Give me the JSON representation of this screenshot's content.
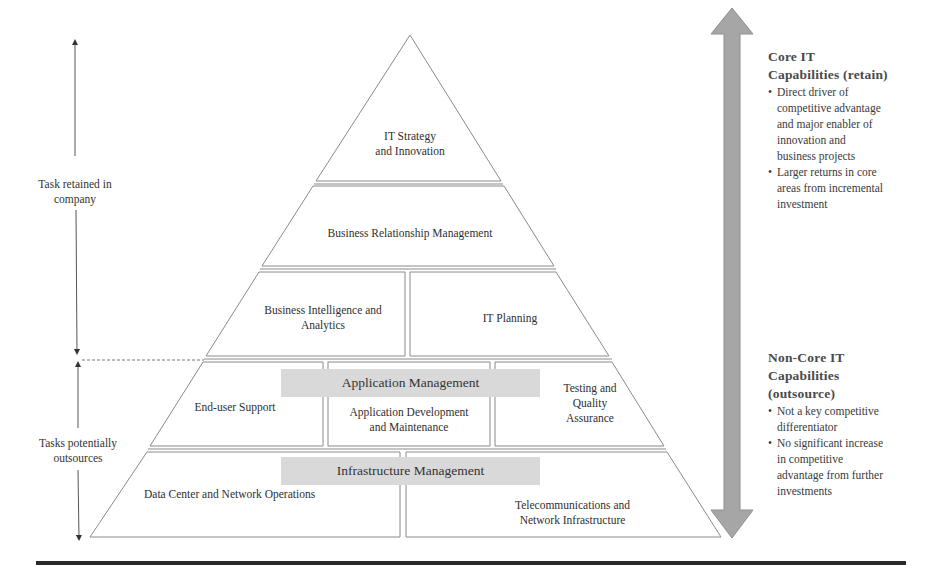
{
  "left_axis": {
    "upper_label": "Task retained in company",
    "upper_label_lines": [
      "Task retained in",
      "company"
    ],
    "lower_label_lines": [
      "Tasks potentially",
      "outsources"
    ]
  },
  "pyramid": {
    "tier1": {
      "lines": [
        "IT Strategy",
        "and Innovation"
      ]
    },
    "tier2": {
      "label": "Business Relationship Management"
    },
    "tier3": {
      "left": {
        "lines": [
          "Business Intelligence and",
          "Analytics"
        ]
      },
      "right": {
        "label": "IT Planning"
      }
    },
    "tier4": {
      "band": "Application Management",
      "left": {
        "label": "End-user Support"
      },
      "center": {
        "lines": [
          "Application Development",
          "and Maintenance"
        ]
      },
      "right": {
        "lines": [
          "Testing and",
          "Quality",
          "Assurance"
        ]
      }
    },
    "tier5": {
      "band": "Infrastructure Management",
      "left": {
        "label": "Data Center and Network Operations"
      },
      "right": {
        "lines": [
          "Telecommunications and",
          "Network Infrastructure"
        ]
      }
    }
  },
  "right_panel": {
    "core": {
      "heading_lines": [
        "Core IT",
        "Capabilities  (retain)"
      ],
      "bullets": [
        {
          "lines": [
            "Direct driver of",
            "competitive advantage",
            "and major enabler of",
            "innovation and",
            "business projects"
          ]
        },
        {
          "lines": [
            "Larger returns in core",
            "areas from incremental",
            "investment"
          ]
        }
      ]
    },
    "noncore": {
      "heading_lines": [
        "Non-Core IT",
        "Capabilities",
        "(outsource)"
      ],
      "bullets": [
        {
          "lines": [
            "Not a key competitive",
            "differentiator"
          ]
        },
        {
          "lines": [
            "No significant  increase",
            "in competitive",
            "advantage from further",
            "investments"
          ]
        }
      ]
    }
  },
  "colors": {
    "band_fill": "#d9d9d9",
    "arrow_fill": "#a6a6a6",
    "line": "#8a8a8a",
    "rule": "#2a2a2a"
  }
}
